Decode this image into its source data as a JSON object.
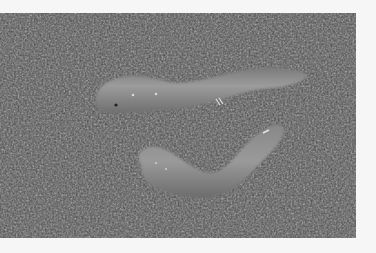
{
  "image": {
    "subject": "Two pale worms lying on coarse gravel/sand",
    "alt": "Grayscale photograph of two worms on gravel",
    "colors": {
      "margin": "#f6f6f6",
      "gravel_dark": "#2e2e2e",
      "gravel_light": "#9a9a9a",
      "worm_body": "#8c8c8c",
      "worm_highlight": "#a8a8a8"
    }
  }
}
